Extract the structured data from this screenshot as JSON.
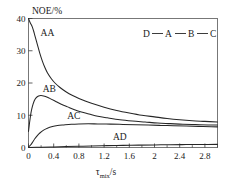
{
  "chart_data": {
    "type": "line",
    "title": "",
    "xlabel": "τmix/s",
    "xlabel_base": "τ",
    "xlabel_sub": "mix",
    "xlabel_unit": "/s",
    "ylabel": "NOE/%",
    "xlim": [
      0,
      3.0
    ],
    "ylim": [
      0,
      40
    ],
    "xticks": [
      0,
      0.4,
      0.8,
      1.2,
      1.6,
      2,
      2.4,
      2.8
    ],
    "xtick_labels": [
      "0",
      "0.4",
      "0.8",
      "1.2",
      "1.6",
      "2",
      "2.4",
      "2.8"
    ],
    "yticks": [
      0,
      10,
      20,
      30,
      40
    ],
    "ytick_labels": [
      "0",
      "10",
      "20",
      "30",
      "40"
    ],
    "minor_xticks": [
      0.2,
      0.6,
      1.0,
      1.4,
      1.8,
      2.2,
      2.6,
      3.0
    ],
    "grid": false,
    "legend_position": "inline-curve-labels",
    "annotation": "D — A — B — C",
    "annotation_nodes": [
      "D",
      "A",
      "B",
      "C"
    ],
    "series": [
      {
        "name": "AA",
        "label": "AA",
        "label_x": 0.3,
        "label_y": 34.5,
        "x": [
          0.0,
          0.02,
          0.04,
          0.06,
          0.08,
          0.1,
          0.14,
          0.18,
          0.22,
          0.26,
          0.3,
          0.36,
          0.42,
          0.5,
          0.6,
          0.7,
          0.8,
          0.9,
          1.0,
          1.2,
          1.4,
          1.6,
          1.8,
          2.0,
          2.2,
          2.4,
          2.6,
          2.8,
          3.0
        ],
        "y": [
          40.0,
          39.0,
          38.2,
          37.4,
          36.2,
          34.8,
          32.0,
          29.2,
          26.8,
          24.8,
          23.2,
          21.4,
          20.0,
          18.6,
          17.2,
          16.1,
          15.2,
          14.4,
          13.7,
          12.5,
          11.5,
          10.7,
          10.0,
          9.5,
          9.0,
          8.6,
          8.3,
          8.1,
          7.9
        ]
      },
      {
        "name": "AB",
        "label": "AB",
        "label_x": 0.33,
        "label_y": 17.3,
        "x": [
          0.0,
          0.02,
          0.04,
          0.06,
          0.09,
          0.12,
          0.16,
          0.2,
          0.24,
          0.3,
          0.36,
          0.44,
          0.52,
          0.62,
          0.72,
          0.84,
          0.96,
          1.1,
          1.25,
          1.45,
          1.65,
          1.85,
          2.05,
          2.25,
          2.45,
          2.65,
          2.85,
          3.0
        ],
        "y": [
          5.0,
          8.2,
          10.8,
          12.6,
          14.4,
          15.4,
          16.0,
          16.1,
          16.0,
          15.6,
          15.0,
          14.2,
          13.4,
          12.6,
          11.8,
          11.0,
          10.4,
          9.7,
          9.2,
          8.6,
          8.2,
          7.9,
          7.6,
          7.4,
          7.2,
          7.1,
          7.0,
          6.95
        ]
      },
      {
        "name": "AC",
        "label": "AC",
        "label_x": 0.72,
        "label_y": 8.7,
        "x": [
          0.0,
          0.03,
          0.06,
          0.1,
          0.14,
          0.18,
          0.24,
          0.3,
          0.38,
          0.46,
          0.56,
          0.68,
          0.8,
          0.95,
          1.1,
          1.3,
          1.5,
          1.7,
          1.9,
          2.1,
          2.3,
          2.5,
          2.7,
          2.9,
          3.0
        ],
        "y": [
          0.2,
          0.7,
          1.5,
          2.7,
          3.7,
          4.5,
          5.4,
          6.0,
          6.5,
          6.8,
          7.0,
          7.2,
          7.3,
          7.35,
          7.3,
          7.25,
          7.15,
          7.05,
          6.95,
          6.85,
          6.75,
          6.65,
          6.55,
          6.45,
          6.4
        ]
      },
      {
        "name": "AD",
        "label": "AD",
        "label_x": 1.45,
        "label_y": 2.4,
        "x": [
          0.0,
          0.2,
          0.4,
          0.6,
          0.8,
          1.0,
          1.25,
          1.5,
          1.75,
          2.0,
          2.25,
          2.5,
          2.75,
          3.0
        ],
        "y": [
          0.0,
          0.08,
          0.18,
          0.28,
          0.38,
          0.48,
          0.58,
          0.66,
          0.74,
          0.8,
          0.86,
          0.9,
          0.94,
          0.97
        ]
      }
    ]
  }
}
